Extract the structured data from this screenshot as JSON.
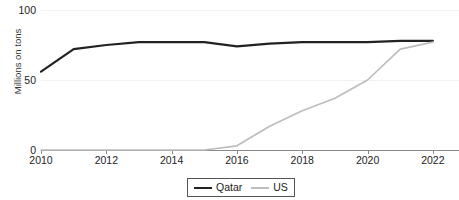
{
  "chart_data": {
    "type": "line",
    "title": "",
    "xlabel": "",
    "ylabel": "Millions on tons",
    "xlim": [
      2010,
      2022.8
    ],
    "ylim": [
      0,
      100
    ],
    "grid": true,
    "legend_position": "bottom-center",
    "x": [
      2010,
      2011,
      2012,
      2013,
      2014,
      2015,
      2016,
      2017,
      2018,
      2019,
      2020,
      2021,
      2022
    ],
    "y_ticks": [
      0,
      50,
      100
    ],
    "y_tick_labels": [
      "0",
      "50",
      "100"
    ],
    "x_ticks": [
      2010,
      2012,
      2014,
      2016,
      2018,
      2020,
      2022
    ],
    "x_tick_labels": [
      "2010",
      "2012",
      "2014",
      "2016",
      "2018",
      "2020",
      "2022"
    ],
    "series": [
      {
        "name": "Qatar",
        "color": "#222222",
        "values": [
          56,
          72,
          75,
          77,
          77,
          77,
          74,
          76,
          77,
          77,
          77,
          78,
          78
        ]
      },
      {
        "name": "US",
        "color": "#bdbdbd",
        "values": [
          0,
          0,
          0,
          0,
          0,
          0,
          3,
          17,
          28,
          37,
          50,
          72,
          77
        ]
      }
    ]
  },
  "legend": {
    "items": [
      {
        "label": "Qatar",
        "color": "#222222"
      },
      {
        "label": "US",
        "color": "#bdbdbd"
      }
    ]
  }
}
